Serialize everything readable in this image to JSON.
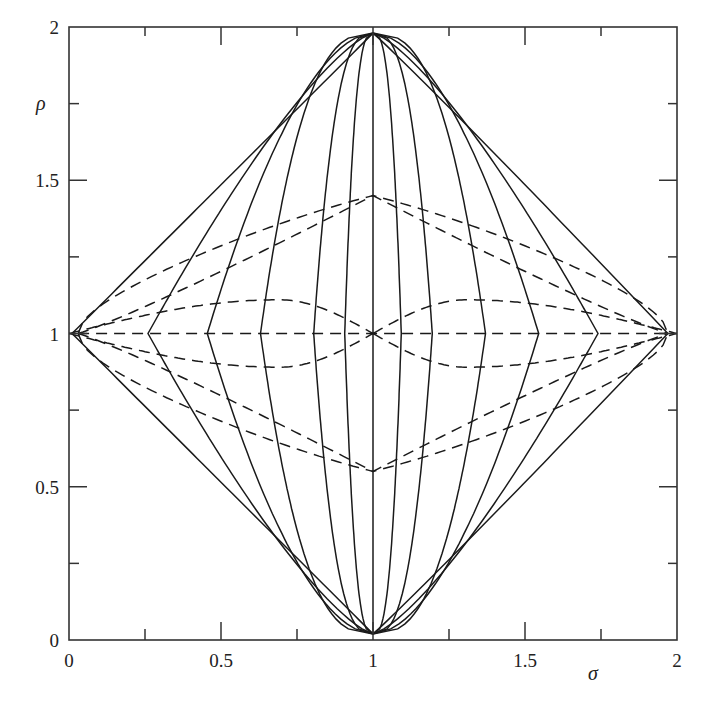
{
  "chart_data": {
    "type": "line",
    "title": "",
    "xlabel": "σ",
    "ylabel": "ρ",
    "xlim": [
      0,
      2
    ],
    "ylim": [
      0,
      2
    ],
    "grid": false,
    "legend": null,
    "x_ticks_major": [
      0,
      0.5,
      1,
      1.5,
      2
    ],
    "x_tick_labels": [
      "0",
      "0.5",
      "1",
      "1.5",
      "2"
    ],
    "x_ticks_minor": [
      0.25,
      0.75,
      1.25,
      1.75
    ],
    "y_ticks_major": [
      0,
      0.5,
      1,
      1.5,
      2
    ],
    "y_tick_labels": [
      "0",
      "0.5",
      "1",
      "1.5",
      "2"
    ],
    "y_ticks_minor": [
      0.25,
      0.75,
      1.25,
      1.75
    ],
    "vertices": {
      "top": [
        1,
        1.98
      ],
      "bottom": [
        1,
        0.02
      ],
      "left": [
        0.01,
        1
      ],
      "right": [
        1.97,
        1
      ]
    },
    "solid_curves": {
      "description": "curves from bottom vertex (1,0) to top vertex (1,2), crossing rho=1 at these sigma values",
      "sigma_at_rho1": [
        0.01,
        0.26,
        0.455,
        0.63,
        0.805,
        0.907,
        1.0,
        1.093,
        1.195,
        1.37,
        1.545,
        1.74,
        1.97
      ]
    },
    "dashed_curves": {
      "description": "curves from left vertex to right vertex; peak rho values",
      "full_arcs_peak_rho": [
        1.0,
        1.36,
        0.64,
        1.45,
        0.55
      ],
      "half_arcs": [
        {
          "from": 0,
          "to": 1,
          "peak_sigma": 0.69,
          "peak_rho": 1.11
        },
        {
          "from": 0,
          "to": 1,
          "peak_sigma": 0.69,
          "peak_rho": 0.89
        },
        {
          "from": 1,
          "to": 2,
          "peak_sigma": 1.31,
          "peak_rho": 1.11
        },
        {
          "from": 1,
          "to": 2,
          "peak_sigma": 1.31,
          "peak_rho": 0.89
        }
      ]
    }
  }
}
